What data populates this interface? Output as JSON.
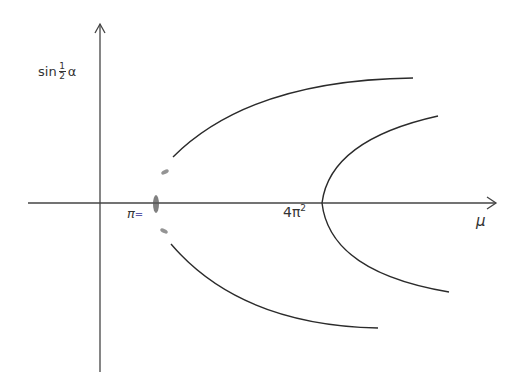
{
  "diagram": {
    "axes": {
      "y_label_prefix": "sin",
      "y_label_frac_num": "1",
      "y_label_frac_den": "2",
      "y_label_var": "α",
      "x_label": "μ"
    },
    "ticks": {
      "pi_symbol": "π",
      "pi_marker": "=",
      "four_pi_base": "4π",
      "four_pi_exp": "2"
    },
    "colors": {
      "line": "#2b2b2b",
      "axis": "#444444",
      "smudge": "#555555",
      "pi_marker": "#5a5aa8"
    },
    "branches": [
      {
        "name": "upper-branch-from-pi",
        "description": "curve rising from near μ=π²/ to upper right"
      },
      {
        "name": "lower-branch-from-pi",
        "description": "curve falling from near μ=π² to lower right"
      },
      {
        "name": "parabola-at-4pi2",
        "description": "sideways parabola opening right with vertex at μ=4π²"
      }
    ]
  }
}
